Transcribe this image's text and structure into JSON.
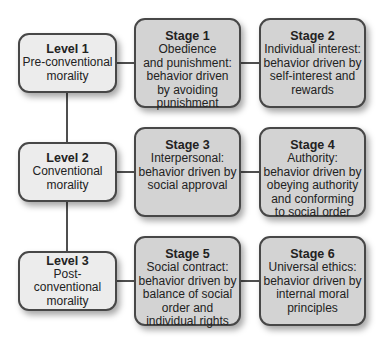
{
  "diagram": {
    "colors": {
      "level_fill": "#ececec",
      "stage_fill": "#d3d3d3",
      "border": "#474747",
      "connector": "#4f4f4f"
    },
    "levels": [
      {
        "title": "Level 1",
        "description": "Pre-conventional\nmorality",
        "stages": [
          {
            "title": "Stage 1",
            "description": "Obedience\nand punishment:\nbehavior driven\nby avoiding\npunishment"
          },
          {
            "title": "Stage 2",
            "description": "Individual interest:\nbehavior driven by\nself-interest and\nrewards"
          }
        ]
      },
      {
        "title": "Level 2",
        "description": "Conventional\nmorality",
        "stages": [
          {
            "title": "Stage 3",
            "description": "Interpersonal:\nbehavior driven by\nsocial approval"
          },
          {
            "title": "Stage 4",
            "description": "Authority:\nbehavior driven by\nobeying authority\nand conforming\nto social order"
          }
        ]
      },
      {
        "title": "Level 3",
        "description": "Post-conventional\nmorality",
        "stages": [
          {
            "title": "Stage 5",
            "description": "Social contract:\nbehavior driven by\nbalance of social\norder and\nindividual rights"
          },
          {
            "title": "Stage 6",
            "description": "Universal ethics:\nbehavior driven by\ninternal moral\nprinciples"
          }
        ]
      }
    ]
  }
}
